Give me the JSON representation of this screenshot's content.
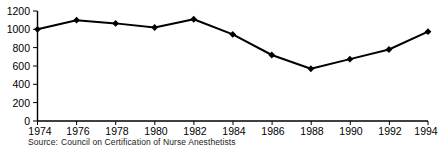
{
  "chart_data": {
    "type": "line",
    "title": "",
    "xlabel": "",
    "ylabel": "",
    "categories": [
      "1974",
      "1976",
      "1978",
      "1980",
      "1982",
      "1984",
      "1986",
      "1988",
      "1990",
      "1992",
      "1994"
    ],
    "x": [
      1974,
      1976,
      1978,
      1980,
      1982,
      1984,
      1986,
      1988,
      1990,
      1992,
      1994
    ],
    "values": [
      1000,
      1100,
      1065,
      1020,
      1110,
      945,
      720,
      570,
      675,
      780,
      975
    ],
    "series": [
      {
        "name": "Nurse Anesthetist Certifications",
        "values": [
          1000,
          1100,
          1065,
          1020,
          1110,
          945,
          720,
          570,
          675,
          780,
          975
        ]
      }
    ],
    "ylim": [
      0,
      1200
    ],
    "xlim": [
      1974,
      1994
    ],
    "ytick_labels": [
      "0",
      "200",
      "400",
      "600",
      "800",
      "1000",
      "1200"
    ],
    "ytick_values": [
      0,
      200,
      400,
      600,
      800,
      1000,
      1200
    ],
    "xtick_labels": [
      "1974",
      "1976",
      "1978",
      "1980",
      "1982",
      "1984",
      "1986",
      "1988",
      "1990",
      "1992",
      "1994"
    ],
    "grid": false,
    "legend": null,
    "marker": "diamond",
    "line_color": "#000000",
    "marker_color": "#000000",
    "axis_color": "#000000"
  },
  "source": {
    "label": "Source:",
    "text": "Council on Certification of Nurse Anesthetists"
  }
}
